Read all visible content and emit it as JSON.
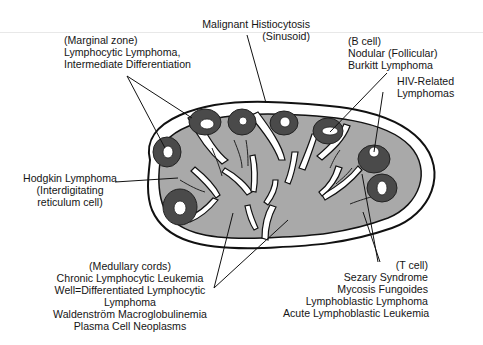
{
  "figure": {
    "colors": {
      "node_fill": "#a9a9a9",
      "follicle_fill": "#4a4a4a",
      "outline": "#111111",
      "background": "#ffffff"
    }
  },
  "labels": {
    "marginal_zone": {
      "lines": [
        "(Marginal zone)",
        "Lymphocytic Lymphoma,",
        "Intermediate Differentiation"
      ]
    },
    "sinusoid": {
      "lines": [
        "Malignant Histiocytosis",
        "(Sinusoid)"
      ]
    },
    "b_cell": {
      "lines": [
        "(B cell)",
        "Nodular (Follicular)",
        "Burkitt Lymphoma"
      ]
    },
    "hiv": {
      "lines": [
        "HIV-Related",
        "Lymphomas"
      ]
    },
    "hodgkin": {
      "lines": [
        "Hodgkin Lymphoma",
        "(Interdigitating",
        "reticulum cell)"
      ]
    },
    "medullary": {
      "lines": [
        "(Medullary cords)",
        "Chronic Lymphocytic Leukemia",
        "Well=Differentiated Lymphocytic",
        "Lymphoma",
        "Waldenström Macroglobulinemia",
        "Plasma Cell Neoplasms"
      ]
    },
    "t_cell": {
      "lines": [
        "(T cell)",
        "Sezary Syndrome",
        "Mycosis Fungoides",
        "Lymphoblastic Lymphoma",
        "Acute Lymphoblastic Leukemia"
      ]
    }
  }
}
